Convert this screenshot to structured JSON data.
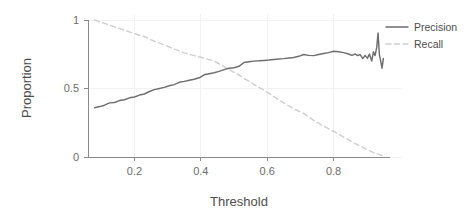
{
  "chart_data": {
    "type": "line",
    "title": "",
    "subtitle": "",
    "xlabel": "Threshold",
    "ylabel": "Proportion",
    "xlim": [
      0.06,
      0.97
    ],
    "ylim": [
      0.0,
      1.0
    ],
    "xticks": [
      0.2,
      0.4,
      0.6,
      0.8
    ],
    "xtick_labels": [
      "0.2",
      "0.4",
      "0.6",
      "0.8"
    ],
    "yticks": [
      0,
      0.5,
      1
    ],
    "ytick_labels": [
      "0",
      "0.5",
      "1"
    ],
    "grid": true,
    "grid_color": "#f2f2f2",
    "legend_position": "right",
    "background": "#ffffff",
    "series": [
      {
        "name": "Precision",
        "style": "solid",
        "color": "#6e6e6e",
        "x": [
          0.08,
          0.095,
          0.11,
          0.125,
          0.14,
          0.155,
          0.17,
          0.185,
          0.2,
          0.215,
          0.23,
          0.245,
          0.26,
          0.275,
          0.29,
          0.305,
          0.32,
          0.335,
          0.35,
          0.365,
          0.38,
          0.395,
          0.41,
          0.425,
          0.44,
          0.455,
          0.47,
          0.485,
          0.5,
          0.515,
          0.53,
          0.545,
          0.56,
          0.575,
          0.59,
          0.605,
          0.62,
          0.635,
          0.65,
          0.665,
          0.68,
          0.695,
          0.71,
          0.725,
          0.74,
          0.755,
          0.77,
          0.785,
          0.8,
          0.815,
          0.83,
          0.845,
          0.855,
          0.865,
          0.872,
          0.88,
          0.888,
          0.895,
          0.902,
          0.908,
          0.915,
          0.92,
          0.925,
          0.93,
          0.934,
          0.938,
          0.942,
          0.946,
          0.95
        ],
        "y": [
          0.36,
          0.368,
          0.378,
          0.395,
          0.398,
          0.412,
          0.418,
          0.432,
          0.438,
          0.452,
          0.46,
          0.478,
          0.492,
          0.5,
          0.508,
          0.52,
          0.528,
          0.545,
          0.552,
          0.56,
          0.568,
          0.578,
          0.6,
          0.608,
          0.615,
          0.625,
          0.638,
          0.648,
          0.652,
          0.662,
          0.69,
          0.695,
          0.7,
          0.702,
          0.705,
          0.708,
          0.712,
          0.715,
          0.718,
          0.722,
          0.726,
          0.735,
          0.748,
          0.742,
          0.74,
          0.748,
          0.755,
          0.762,
          0.772,
          0.768,
          0.762,
          0.752,
          0.742,
          0.752,
          0.74,
          0.748,
          0.718,
          0.742,
          0.72,
          0.752,
          0.7,
          0.768,
          0.74,
          0.8,
          0.905,
          0.748,
          0.7,
          0.648,
          0.72
        ]
      },
      {
        "name": "Recall",
        "style": "dashed",
        "color": "#cfcfcf",
        "x": [
          0.08,
          0.11,
          0.14,
          0.17,
          0.2,
          0.23,
          0.26,
          0.29,
          0.32,
          0.35,
          0.38,
          0.41,
          0.44,
          0.47,
          0.5,
          0.53,
          0.56,
          0.59,
          0.62,
          0.65,
          0.68,
          0.71,
          0.74,
          0.77,
          0.8,
          0.83,
          0.86,
          0.89,
          0.92,
          0.95
        ],
        "y": [
          1.0,
          0.975,
          0.95,
          0.925,
          0.9,
          0.878,
          0.845,
          0.818,
          0.788,
          0.76,
          0.74,
          0.722,
          0.7,
          0.66,
          0.618,
          0.575,
          0.53,
          0.488,
          0.44,
          0.395,
          0.352,
          0.318,
          0.268,
          0.225,
          0.188,
          0.145,
          0.105,
          0.068,
          0.032,
          0.008
        ]
      }
    ]
  },
  "legend": {
    "entries": [
      {
        "label": "Precision",
        "style": "solid",
        "color": "#6e6e6e"
      },
      {
        "label": "Recall",
        "style": "dashed",
        "color": "#cfcfcf"
      }
    ]
  },
  "axes": {
    "x_title": "Threshold",
    "y_title": "Proportion"
  }
}
